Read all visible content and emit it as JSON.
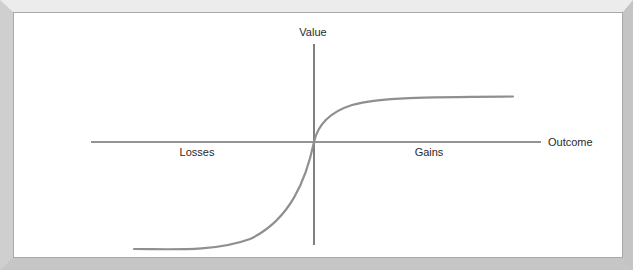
{
  "diagram": {
    "type": "prospect-theory-value-function",
    "labels": {
      "y_axis": "Value",
      "x_axis": "Outcome",
      "left_region": "Losses",
      "right_region": "Gains"
    },
    "colors": {
      "axis": "#2b2b2b",
      "curve": "#8f8f8f",
      "panel": "#ffffff",
      "frame": "#cfcfcf"
    }
  }
}
